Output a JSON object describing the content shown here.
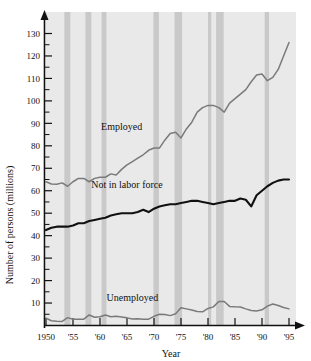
{
  "chart_data": {
    "type": "line",
    "title": "",
    "xlabel": "Year",
    "ylabel": "Number of persons (millions)",
    "xlim": [
      1950,
      1995
    ],
    "ylim": [
      0,
      135
    ],
    "ytick_step_major": 10,
    "ytick_step_minor": 5,
    "grid": false,
    "legend_position": "inline-annotations",
    "background_plot_color": "#e9e9e9",
    "recession_band_color": "#c9c9c9",
    "xticks": [
      1950,
      1955,
      1960,
      1965,
      1970,
      1975,
      1980,
      1985,
      1990,
      1995
    ],
    "xtick_labels": [
      "1950",
      "'55",
      "'60",
      "'65",
      "'70",
      "'75",
      "'80",
      "'85",
      "'90",
      "'95"
    ],
    "yticks": [
      10,
      20,
      30,
      40,
      50,
      60,
      70,
      80,
      90,
      100,
      110,
      120,
      130
    ],
    "ytick_labels": [
      "10",
      "20",
      "30",
      "40",
      "50",
      "60",
      "70",
      "80",
      "90",
      "100",
      "110",
      "120",
      "130"
    ],
    "recession_bands": [
      {
        "start": 1953.4,
        "end": 1954.5
      },
      {
        "start": 1957.3,
        "end": 1958.4
      },
      {
        "start": 1960.3,
        "end": 1961.2
      },
      {
        "start": 1969.9,
        "end": 1970.9
      },
      {
        "start": 1973.8,
        "end": 1975.2
      },
      {
        "start": 1980.0,
        "end": 1980.6
      },
      {
        "start": 1981.5,
        "end": 1982.9
      },
      {
        "start": 1990.5,
        "end": 1991.3
      }
    ],
    "series": [
      {
        "name": "Employed",
        "color": "#7a7a7a",
        "label_x": 1964,
        "label_y": 87,
        "x": [
          1950,
          1951,
          1952,
          1953,
          1954,
          1955,
          1956,
          1957,
          1958,
          1959,
          1960,
          1961,
          1962,
          1963,
          1964,
          1965,
          1966,
          1967,
          1968,
          1969,
          1970,
          1971,
          1972,
          1973,
          1974,
          1975,
          1976,
          1977,
          1978,
          1979,
          1980,
          1981,
          1982,
          1983,
          1984,
          1985,
          1986,
          1987,
          1988,
          1989,
          1990,
          1991,
          1992,
          1993,
          1994,
          1995
        ],
        "values": [
          64.0,
          63.0,
          62.9,
          63.5,
          62.0,
          64.0,
          65.5,
          65.5,
          64.0,
          65.5,
          66.0,
          66.0,
          67.5,
          67.0,
          69.5,
          71.5,
          73.0,
          74.5,
          76.0,
          78.0,
          79.0,
          79.0,
          82.5,
          85.5,
          86.0,
          83.5,
          87.5,
          90.5,
          95.0,
          97.0,
          98.0,
          98.0,
          97.0,
          95.0,
          99.0,
          101.0,
          103.0,
          105.0,
          108.5,
          111.5,
          112.0,
          109.0,
          110.5,
          114.0,
          120.0,
          126.0
        ]
      },
      {
        "name": "Not in labor force",
        "color": "#111111",
        "label_x": 1965,
        "label_y": 61,
        "x": [
          1950,
          1951,
          1952,
          1953,
          1954,
          1955,
          1956,
          1957,
          1958,
          1959,
          1960,
          1961,
          1962,
          1963,
          1964,
          1965,
          1966,
          1967,
          1968,
          1969,
          1970,
          1971,
          1972,
          1973,
          1974,
          1975,
          1976,
          1977,
          1978,
          1979,
          1980,
          1981,
          1982,
          1983,
          1984,
          1985,
          1986,
          1987,
          1988,
          1989,
          1990,
          1991,
          1992,
          1993,
          1994,
          1995
        ],
        "values": [
          42.5,
          43.5,
          44.0,
          44.0,
          44.0,
          44.5,
          45.5,
          45.5,
          46.5,
          47.0,
          47.5,
          48.0,
          49.0,
          49.5,
          50.0,
          50.0,
          50.0,
          50.5,
          51.5,
          50.5,
          52.0,
          53.0,
          53.5,
          54.0,
          54.0,
          54.5,
          55.0,
          55.5,
          55.5,
          55.0,
          54.5,
          54.0,
          54.5,
          55.0,
          55.5,
          55.5,
          56.5,
          56.0,
          53.0,
          58.0,
          60.0,
          62.0,
          63.5,
          64.5,
          65.0,
          65.0
        ]
      },
      {
        "name": "Unemployed",
        "color": "#7a7a7a",
        "label_x": 1966,
        "label_y": 11,
        "x": [
          1950,
          1951,
          1952,
          1953,
          1954,
          1955,
          1956,
          1957,
          1958,
          1959,
          1960,
          1961,
          1962,
          1963,
          1964,
          1965,
          1966,
          1967,
          1968,
          1969,
          1970,
          1971,
          1972,
          1973,
          1974,
          1975,
          1976,
          1977,
          1978,
          1979,
          1980,
          1981,
          1982,
          1983,
          1984,
          1985,
          1986,
          1987,
          1988,
          1989,
          1990,
          1991,
          1992,
          1993,
          1994,
          1995
        ],
        "values": [
          3.3,
          2.1,
          1.9,
          1.8,
          3.5,
          2.8,
          2.8,
          2.8,
          4.7,
          3.7,
          3.9,
          4.7,
          3.9,
          4.1,
          3.8,
          3.4,
          2.9,
          3.0,
          2.8,
          2.8,
          4.1,
          5.0,
          4.9,
          4.4,
          5.2,
          7.9,
          7.4,
          6.9,
          6.2,
          6.1,
          7.6,
          8.3,
          10.7,
          10.7,
          8.5,
          8.3,
          8.2,
          7.4,
          6.7,
          6.5,
          7.0,
          8.6,
          9.6,
          8.9,
          8.0,
          7.4
        ]
      }
    ]
  }
}
